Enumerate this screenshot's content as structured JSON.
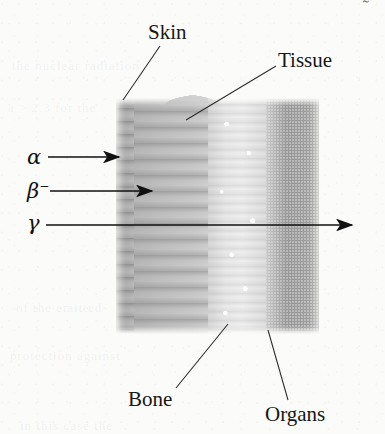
{
  "figure": {
    "background_color": "#fbfbfa",
    "ink_color": "#171717"
  },
  "radiation_labels": [
    {
      "id": "alpha",
      "symbol": "α",
      "superscript": "",
      "x": 27,
      "y": 147,
      "arrow_from_x": 48,
      "arrow_to_x": 119,
      "arrow_y": 157,
      "description": "alpha particles stopped at skin"
    },
    {
      "id": "beta",
      "symbol": "β",
      "superscript": "−",
      "x": 27,
      "y": 180,
      "arrow_from_x": 50,
      "arrow_to_x": 152,
      "arrow_y": 191,
      "description": "beta particles stopped in tissue"
    },
    {
      "id": "gamma",
      "symbol": "γ",
      "superscript": "",
      "x": 27,
      "y": 213,
      "arrow_from_x": 46,
      "arrow_to_x": 352,
      "arrow_y": 225,
      "description": "gamma rays pass completely through the body"
    }
  ],
  "anatomy_labels": [
    {
      "id": "skin",
      "text": "Skin",
      "x": 148,
      "y": 22,
      "leader_from_x": 160,
      "leader_from_y": 46,
      "leader_to_x": 123,
      "leader_to_y": 100
    },
    {
      "id": "tissue",
      "text": "Tissue",
      "x": 278,
      "y": 50,
      "leader_from_x": 276,
      "leader_from_y": 66,
      "leader_to_x": 186,
      "leader_to_y": 120
    },
    {
      "id": "bone",
      "text": "Bone",
      "x": 128,
      "y": 389,
      "leader_from_x": 176,
      "leader_from_y": 388,
      "leader_to_x": 228,
      "leader_to_y": 324
    },
    {
      "id": "organs",
      "text": "Organs",
      "x": 265,
      "y": 404,
      "leader_from_x": 288,
      "leader_from_y": 400,
      "leader_to_x": 268,
      "leader_to_y": 330
    }
  ],
  "body_layers": [
    {
      "id": "skin",
      "name": "Skin",
      "shade": "#b2b2b2"
    },
    {
      "id": "tissue",
      "name": "Tissue",
      "shade": "#bcbcbc"
    },
    {
      "id": "bone",
      "name": "Bone",
      "shade": "#ebebeb"
    },
    {
      "id": "organs",
      "name": "Organs",
      "shade": "#bababa"
    }
  ],
  "artifacts": {
    "corner_mark": "˜",
    "ghost_lines": [
      "the nuclear radiation",
      "a > 2.3 for the",
      "of the emitted",
      "protection against",
      "in this case the"
    ]
  }
}
